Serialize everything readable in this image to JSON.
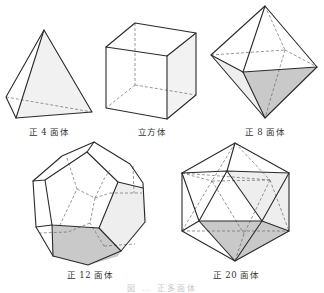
{
  "figure": {
    "colors": {
      "edge": "#2a2a2a",
      "hidden_edge": "#6a6a6a",
      "shade_dark": "#c9c9c9",
      "shade_light": "#eeeeee",
      "label": "#333333"
    },
    "solids": [
      {
        "id": "tetrahedron",
        "label": "正 4 面体",
        "faces": 4
      },
      {
        "id": "cube",
        "label": "立方体",
        "faces": 6
      },
      {
        "id": "octahedron",
        "label": "正 8 面体",
        "faces": 8
      },
      {
        "id": "dodecahedron",
        "label": "正 12 面体",
        "faces": 12
      },
      {
        "id": "icosahedron",
        "label": "正 20 面体",
        "faces": 20
      }
    ],
    "caption": "図 … 正多面体"
  }
}
